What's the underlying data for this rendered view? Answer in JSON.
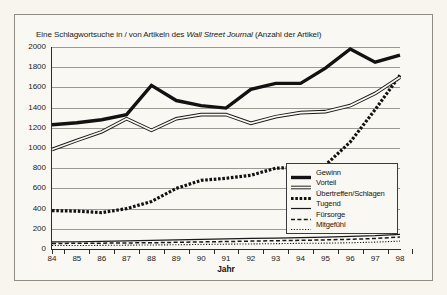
{
  "figure": {
    "background_color": "#f7f5ee",
    "plate_color": "#faf8f2",
    "border_color": "#8d8d85"
  },
  "title_parts": {
    "before": "Eine Schlagwortsuche in / von Artikeln des ",
    "italic": "Wall Street Journal",
    "after": " (Anzahl der Artikel)"
  },
  "chart_data": {
    "type": "line",
    "title": "Eine Schlagwortsuche in / von Artikeln des Wall Street Journal (Anzahl der Artikel)",
    "xlabel": "Jahr",
    "ylabel": "",
    "categories": [
      "84",
      "85",
      "86",
      "87",
      "88",
      "89",
      "90",
      "91",
      "92",
      "93",
      "94",
      "95",
      "96",
      "97",
      "98"
    ],
    "x": [
      84,
      85,
      86,
      87,
      88,
      89,
      90,
      91,
      92,
      93,
      94,
      95,
      96,
      97,
      98
    ],
    "ylim": [
      0,
      2000
    ],
    "yticks": [
      0,
      200,
      400,
      600,
      800,
      1000,
      1200,
      1400,
      1600,
      1800,
      2000
    ],
    "grid": true,
    "legend_position": "lower-right-inside",
    "series": [
      {
        "name": "Gewinn",
        "style": "thick-solid",
        "color": "#121212",
        "values": [
          1230,
          1250,
          1280,
          1330,
          1620,
          1470,
          1420,
          1395,
          1580,
          1640,
          1640,
          1790,
          1980,
          1850,
          1920
        ]
      },
      {
        "name": "Vorteil",
        "style": "double-outline",
        "color": "#1a1a1a",
        "values": [
          985,
          1075,
          1160,
          1290,
          1175,
          1290,
          1330,
          1330,
          1245,
          1310,
          1350,
          1360,
          1420,
          1540,
          1700
        ]
      },
      {
        "name": "Übertreffen/Schlagen",
        "style": "dotted-thick",
        "color": "#111111",
        "values": [
          380,
          375,
          360,
          400,
          470,
          600,
          680,
          700,
          730,
          800,
          810,
          830,
          1060,
          1380,
          1720
        ]
      },
      {
        "name": "Tugend",
        "style": "thin-solid",
        "color": "#1a1a1a",
        "values": [
          70,
          72,
          75,
          80,
          85,
          90,
          95,
          100,
          105,
          108,
          112,
          118,
          125,
          132,
          145
        ]
      },
      {
        "name": "Fürsorge",
        "style": "dashed",
        "color": "#1a1a1a",
        "values": [
          55,
          56,
          58,
          60,
          62,
          66,
          70,
          74,
          78,
          82,
          86,
          90,
          96,
          104,
          118
        ]
      },
      {
        "name": "Mitgefühl",
        "style": "dotted-fine",
        "color": "#1a1a1a",
        "values": [
          35,
          34,
          36,
          38,
          40,
          42,
          45,
          48,
          50,
          53,
          56,
          58,
          62,
          68,
          78
        ]
      }
    ]
  }
}
